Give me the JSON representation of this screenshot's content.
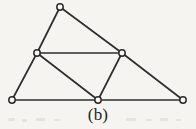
{
  "figure": {
    "caption": "(b)",
    "type": "geometry-diagram",
    "background_color": "#f6f4f1",
    "line_color": "#2e2e2e",
    "vertex_fill_color": "#f8f7f4",
    "vertex_stroke_color": "#2b2b2b",
    "vertex_radius": 3.2,
    "line_width": 1.7,
    "view_box": "0 0 196 129",
    "vertices": [
      {
        "id": "apex",
        "name": "top-apex-vertex",
        "x": 60,
        "y": 7
      },
      {
        "id": "left-mid",
        "name": "left-midpoint-vertex",
        "x": 37,
        "y": 53
      },
      {
        "id": "right-mid",
        "name": "right-midpoint-vertex",
        "x": 122,
        "y": 53
      },
      {
        "id": "bottom-left",
        "name": "bottom-left-vertex",
        "x": 12,
        "y": 100
      },
      {
        "id": "bottom-mid",
        "name": "bottom-midpoint-vertex",
        "x": 98,
        "y": 100
      },
      {
        "id": "bottom-right",
        "name": "bottom-right-vertex",
        "x": 183,
        "y": 100
      }
    ],
    "edges": [
      {
        "name": "edge-apex-to-left-mid",
        "from": "apex",
        "to": "left-mid"
      },
      {
        "name": "edge-apex-to-right-mid",
        "from": "apex",
        "to": "right-mid"
      },
      {
        "name": "edge-left-mid-to-right-mid",
        "from": "left-mid",
        "to": "right-mid"
      },
      {
        "name": "edge-left-mid-to-bottom-left",
        "from": "left-mid",
        "to": "bottom-left"
      },
      {
        "name": "edge-left-mid-to-bottom-mid",
        "from": "left-mid",
        "to": "bottom-mid"
      },
      {
        "name": "edge-right-mid-to-bottom-mid",
        "from": "right-mid",
        "to": "bottom-mid"
      },
      {
        "name": "edge-right-mid-to-bottom-right",
        "from": "right-mid",
        "to": "bottom-right"
      },
      {
        "name": "edge-bottom-left-to-bottom-mid",
        "from": "bottom-left",
        "to": "bottom-mid"
      },
      {
        "name": "edge-bottom-mid-to-bottom-right",
        "from": "bottom-mid",
        "to": "bottom-right"
      }
    ],
    "specks": [
      {
        "x": 8,
        "y": 118,
        "w": 7,
        "h": 3
      },
      {
        "x": 22,
        "y": 119,
        "w": 5,
        "h": 3
      },
      {
        "x": 36,
        "y": 118,
        "w": 9,
        "h": 3
      },
      {
        "x": 54,
        "y": 119,
        "w": 6,
        "h": 2
      },
      {
        "x": 126,
        "y": 118,
        "w": 10,
        "h": 3
      },
      {
        "x": 146,
        "y": 119,
        "w": 6,
        "h": 2
      },
      {
        "x": 160,
        "y": 118,
        "w": 8,
        "h": 3
      },
      {
        "x": 176,
        "y": 119,
        "w": 5,
        "h": 2
      }
    ]
  }
}
